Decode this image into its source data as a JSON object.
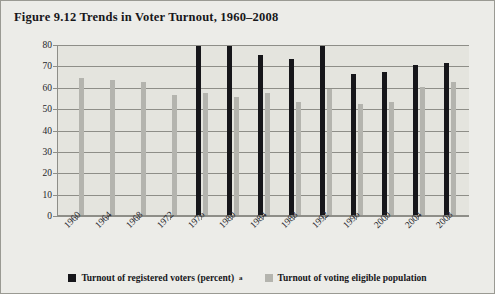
{
  "figure": {
    "title": "Figure 9.12 Trends in Voter Turnout, 1960–2008"
  },
  "legend": {
    "items": [
      {
        "label": "Turnout of registered voters (percent)",
        "superscript": "a",
        "color": "#16161a",
        "swatch": "legend-swatch-dark"
      },
      {
        "label": "Turnout of voting eligible population",
        "superscript": "",
        "color": "#b4b4ae",
        "swatch": "legend-swatch-light"
      }
    ]
  },
  "chart_data": {
    "type": "bar",
    "title": "Trends in Voter Turnout, 1960–2008",
    "xlabel": "",
    "ylabel": "",
    "ylim": [
      0,
      80
    ],
    "yticks": [
      0,
      10,
      20,
      30,
      40,
      50,
      60,
      70,
      80
    ],
    "grid": true,
    "legend_position": "bottom",
    "categories": [
      "1960",
      "1964",
      "1968",
      "1972",
      "1976",
      "1980",
      "1984",
      "1988",
      "1992",
      "1996",
      "2000",
      "2004",
      "2008"
    ],
    "series": [
      {
        "name": "Turnout of registered voters (percent)",
        "color": "#16161a",
        "values": [
          null,
          null,
          null,
          null,
          79,
          79,
          75,
          73,
          79,
          66,
          67,
          70,
          71
        ]
      },
      {
        "name": "Turnout of voting eligible population",
        "color": "#b4b4ae",
        "values": [
          64,
          63,
          62,
          56,
          57,
          55,
          57,
          53,
          59,
          52,
          53,
          60,
          62
        ]
      }
    ]
  }
}
